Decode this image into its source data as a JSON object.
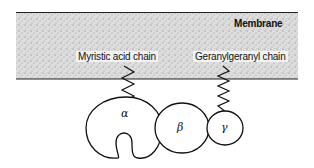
{
  "diagram": {
    "membrane_label": "Membrane",
    "anchors": [
      {
        "label": "Myristic acid chain",
        "attached_to": "alpha"
      },
      {
        "label": "Geranylgeranyl chain",
        "attached_to": "gamma"
      }
    ],
    "subunits": [
      {
        "id": "alpha",
        "symbol": "α"
      },
      {
        "id": "beta",
        "symbol": "β"
      },
      {
        "id": "gamma",
        "symbol": "γ"
      }
    ]
  }
}
